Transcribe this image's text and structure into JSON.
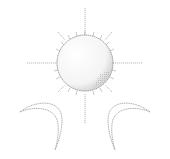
{
  "illustration": {
    "subject": "sun-and-two-crescent-moons",
    "colors": {
      "background": "#ffffff",
      "line": "#9a9a9a",
      "shade": "#b8b8b8"
    },
    "elements": [
      {
        "name": "sun",
        "icon": "sun-icon"
      },
      {
        "name": "left-crescent",
        "icon": "crescent-moon-icon"
      },
      {
        "name": "right-crescent",
        "icon": "crescent-moon-icon"
      }
    ]
  }
}
